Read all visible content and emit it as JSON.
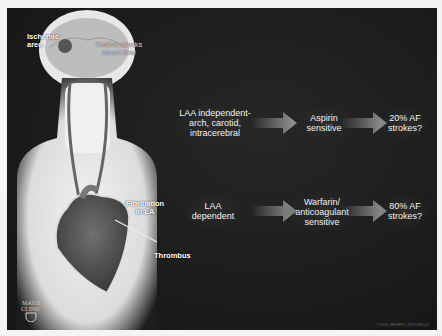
{
  "diagram": {
    "labels": {
      "ischemic_area": "Ischemic area",
      "emboli": "Emboli blocks blood flow",
      "fibrillation": "Fibrillation in LA",
      "thrombus": "Thrombus"
    },
    "rows": [
      {
        "source": "LAA independent-arch, carotid, intracerebral",
        "treatment": "Aspirin sensitive",
        "outcome": "20% AF strokes?"
      },
      {
        "source": "LAA dependent",
        "treatment": "Warfarin/ anticoagulant sensitive",
        "outcome": "80% AF strokes?"
      }
    ],
    "logo": {
      "line1": "MAYO",
      "line2": "CLINIC"
    },
    "credit": "©2011 MFMER | 3177488-01"
  },
  "colors": {
    "background": "#1c1c1c",
    "text": "#ffffff",
    "arrow": "#9a9a9a"
  }
}
